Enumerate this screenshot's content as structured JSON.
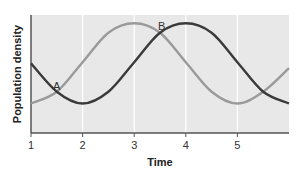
{
  "chart_data": {
    "type": "line",
    "title": "",
    "xlabel": "Time",
    "ylabel": "Population density",
    "xlim": [
      1,
      6
    ],
    "ylim": [
      0,
      1
    ],
    "x_ticks": [
      1,
      2,
      3,
      4,
      5
    ],
    "y_ticks": [],
    "grid": {
      "vertical": true,
      "horizontal": false
    },
    "legend": "none (curves labeled directly)",
    "background": "#e8e8e8",
    "series": [
      {
        "name": "A",
        "color": "#9a9a9a",
        "x": [
          1,
          1.5,
          2,
          2.5,
          3,
          3.5,
          4,
          4.5,
          5,
          5.5,
          6
        ],
        "values": [
          0.25,
          0.35,
          0.6,
          0.85,
          0.93,
          0.85,
          0.6,
          0.35,
          0.25,
          0.35,
          0.55
        ]
      },
      {
        "name": "B",
        "color": "#3a3a3a",
        "x": [
          1,
          1.5,
          2,
          2.5,
          3,
          3.5,
          4,
          4.5,
          5,
          5.5,
          6
        ],
        "values": [
          0.59,
          0.35,
          0.25,
          0.35,
          0.6,
          0.85,
          0.93,
          0.85,
          0.6,
          0.35,
          0.25
        ]
      }
    ],
    "annotations": [
      {
        "text": "A",
        "x": 1.5,
        "y": 0.42
      },
      {
        "text": "B",
        "x": 3.53,
        "y": 0.97
      }
    ]
  },
  "labels": {
    "xlabel": "Time",
    "ylabel": "Population density",
    "ticks": [
      "1",
      "2",
      "3",
      "4",
      "5"
    ],
    "curve_a": "A",
    "curve_b": "B"
  }
}
